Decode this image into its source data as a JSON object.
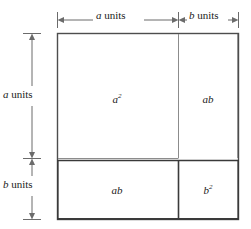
{
  "figure": {
    "identity": "(a + b)^2 = a^2 + 2ab + b^2",
    "colors": {
      "outer_border": "#4d4d4d",
      "heavy_border": "#3a3a3a",
      "inner_line": "#8c8c8c",
      "arrow": "#6b6b6b",
      "text": "#1a1a1a",
      "background": "#ffffff"
    },
    "geometry": {
      "square_left": 57,
      "square_top": 33,
      "square_right": 238,
      "square_bottom": 219,
      "vertical_divider_x": 178,
      "horizontal_divider_y": 158
    },
    "dimensions": {
      "top": [
        {
          "id": "top-a",
          "variable": "a",
          "unit_text": " units",
          "span": "a"
        },
        {
          "id": "top-b",
          "variable": "b",
          "unit_text": " units",
          "span": "b"
        }
      ],
      "left": [
        {
          "id": "left-a",
          "variable": "a",
          "unit_text": " units",
          "span": "a"
        },
        {
          "id": "left-b",
          "variable": "b",
          "unit_text": " units",
          "span": "b"
        }
      ]
    },
    "cells": [
      {
        "id": "top-left",
        "base": "a",
        "exponent": "2",
        "area": "a squared",
        "row": "top",
        "col": "left"
      },
      {
        "id": "top-right",
        "base": "ab",
        "exponent": "",
        "area": "a times b",
        "row": "top",
        "col": "right"
      },
      {
        "id": "bottom-left",
        "base": "ab",
        "exponent": "",
        "area": "a times b",
        "row": "bottom",
        "col": "left"
      },
      {
        "id": "bottom-right",
        "base": "b",
        "exponent": "2",
        "area": "b squared",
        "row": "bottom",
        "col": "right"
      }
    ]
  }
}
